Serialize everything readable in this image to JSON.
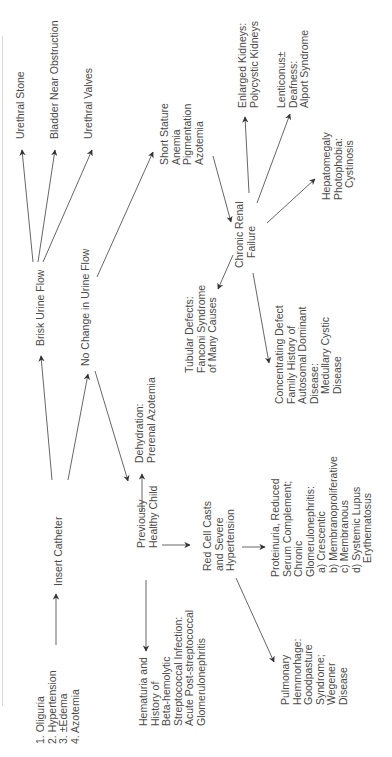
{
  "diagram": {
    "orientation": "rotated-90-ccw",
    "colors": {
      "text": "#4a4a4a",
      "line": "#555555",
      "background": "#ffffff"
    },
    "nodes": {
      "presentation": {
        "lines": [
          "1.  Oliguria",
          "2.  Hypertension",
          "3.  ±Edema",
          "4.  Azotemia"
        ]
      },
      "insert_catheter": {
        "lines": [
          "Insert Catheter"
        ]
      },
      "brisk_urine_flow": {
        "lines": [
          "Brisk Urine Flow"
        ]
      },
      "urethral_stone": {
        "lines": [
          "Urethral Stone"
        ]
      },
      "bladder_near_obstruction": {
        "lines": [
          "Bladder Near Obstruction"
        ]
      },
      "urethral_valves": {
        "lines": [
          "Urethral Valves"
        ]
      },
      "no_change_urine_flow": {
        "lines": [
          "No Change in Urine Flow"
        ]
      },
      "short_stature": {
        "lines": [
          "Short Stature",
          "Anemia",
          "Pigmentation",
          "Azotemia"
        ]
      },
      "chronic_renal_failure": {
        "lines": [
          "Chronic Renal",
          "Failure"
        ]
      },
      "enlarged_kidneys": {
        "lines": [
          "Enlarged Kidneys:",
          "Polycystic Kidneys"
        ]
      },
      "lenticonus": {
        "lines": [
          "Lenticonus±",
          "Deafness:",
          "Alport Syndrome"
        ]
      },
      "hepatomegaly": {
        "lines": [
          "Hepatomegaly",
          "Photophobia:",
          "Cystinosis"
        ]
      },
      "tubular_defects": {
        "lines": [
          "Tubular Defects:",
          "Fanconi Syndrome",
          "of Many Causes"
        ]
      },
      "concentrating_defect": {
        "lines": [
          "Concentrating Defect",
          "Family History of",
          "Autosomal Dominant",
          "Disease:",
          "   Medullary Cystic",
          "   Disease"
        ]
      },
      "dehydration": {
        "lines": [
          "Dehydration:",
          "Prerenal Azotemia"
        ]
      },
      "previously_healthy_child": {
        "lines": [
          "Previously",
          "Healthy Child"
        ]
      },
      "red_cell_casts": {
        "lines": [
          "Red Cell Casts",
          "and Severe",
          "Hypertension"
        ]
      },
      "proteinuria": {
        "lines": [
          "Proteinuria, Reduced",
          "Serum Complement;",
          "Chronic",
          "Glomerulonephritis:",
          "   a) Crescentic",
          "   b) Membranoproliferative",
          "   c) Membranous",
          "   d) Systemic Lupus",
          "        Erythematosus"
        ]
      },
      "hematuria": {
        "lines": [
          "Hematuria and",
          "History of",
          "Beta-hemolytic",
          "Streptococcal Infection:",
          "Acute Post-streptococcal",
          "Glomerulonephritis"
        ]
      },
      "pulmonary_hemorrhage": {
        "lines": [
          "Pulmonary",
          "Hemmorhage:",
          "Goodpasture",
          "Syndrome;",
          "Wegener",
          "Disease"
        ]
      }
    }
  }
}
